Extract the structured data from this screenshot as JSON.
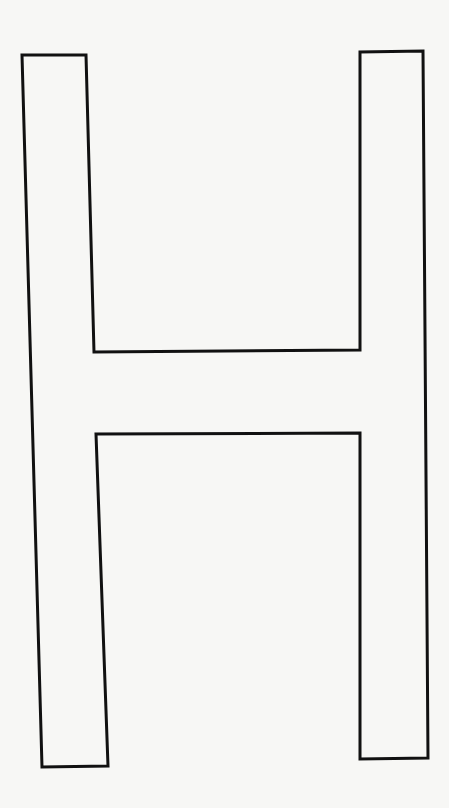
{
  "figure": {
    "background_color": "#f7f7f5",
    "stroke_color": "#111111",
    "stroke_width": 3,
    "outline_points": "22,55 86,55 94,352 360,350 360,52 423,51 428,758 360,759 360,433 96,434 108,766 42,767"
  }
}
